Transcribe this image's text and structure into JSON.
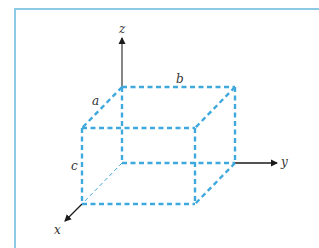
{
  "diagram": {
    "colors": {
      "frame": "#8cc9e2",
      "box_edges": "#3fa9dd",
      "axes": "#1a1a1a",
      "labels": "#333333"
    },
    "axes": {
      "x": {
        "label": "x"
      },
      "y": {
        "label": "y"
      },
      "z": {
        "label": "z"
      }
    },
    "dimensions": {
      "a": {
        "label": "a"
      },
      "b": {
        "label": "b"
      },
      "c": {
        "label": "c"
      }
    }
  }
}
